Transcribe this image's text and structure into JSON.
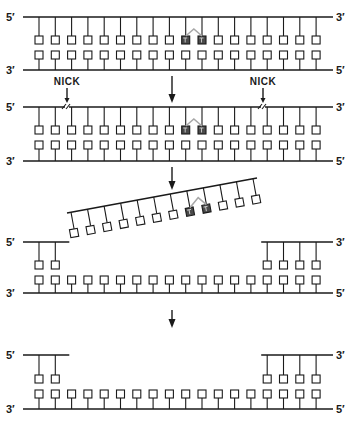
{
  "figure": {
    "width": 352,
    "height": 430,
    "colors": {
      "line": "#1a1a1a",
      "dimer": "#4a4a4a",
      "bridge": "#a8a8a8",
      "background": "#ffffff"
    }
  },
  "labels": {
    "five_prime": "5′",
    "three_prime": "3′",
    "nick": "NICK"
  },
  "layout": {
    "x_first": 39,
    "spacing": 16.3,
    "count": 18,
    "line_left": 23,
    "line_right": 333,
    "box": 8,
    "dimer_indices": [
      9,
      10
    ]
  },
  "panels": [
    {
      "id": "damaged-duplex",
      "top_y": 17,
      "top_box_y": 36,
      "bottom_box_y": 51,
      "bottom_y": 70,
      "top_segments": [
        [
          0,
          17
        ]
      ],
      "bottom_full": true,
      "dimer": true,
      "left_top_label": "5′",
      "right_top_label": "3′",
      "left_bottom_label": "3′",
      "right_bottom_label": "5′"
    },
    {
      "id": "nicked-duplex",
      "top_y": 107,
      "top_box_y": 126,
      "bottom_box_y": 141,
      "bottom_y": 161,
      "top_segments": [
        [
          0,
          17
        ]
      ],
      "bottom_full": true,
      "dimer": true,
      "nicks": [
        {
          "x": 67,
          "label": "NICK"
        },
        {
          "x": 263,
          "label": "NICK"
        }
      ],
      "left_top_label": "5′",
      "right_top_label": "3′",
      "left_bottom_label": "3′",
      "right_bottom_label": "5′"
    },
    {
      "id": "gapped-duplex",
      "top_y": 242,
      "top_box_y": 261,
      "bottom_box_y": 276,
      "bottom_y": 293,
      "top_segments": [
        [
          0,
          1
        ],
        [
          14,
          17
        ]
      ],
      "bottom_full": true,
      "dimer": false,
      "left_top_label": "5′",
      "right_top_label": "3′",
      "left_bottom_label": "3′",
      "right_bottom_label": "5′"
    },
    {
      "id": "repaired-gap-duplex",
      "top_y": 355,
      "top_box_y": 375,
      "bottom_box_y": 390,
      "bottom_y": 409,
      "top_segments": [
        [
          0,
          1
        ],
        [
          14,
          17
        ]
      ],
      "bottom_full": true,
      "dimer": false,
      "left_top_label": "5′",
      "right_top_label": "3′",
      "left_bottom_label": "3′",
      "right_bottom_label": "5′"
    }
  ],
  "excised_fragment": {
    "start": [
      67,
      213
    ],
    "end": [
      257,
      178
    ],
    "count": 12,
    "dimer_indices": [
      7,
      8
    ],
    "tick_length": 17
  },
  "arrows": [
    {
      "x": 172,
      "y1": 76,
      "y2": 103
    },
    {
      "x": 172,
      "y1": 167,
      "y2": 190
    },
    {
      "x": 172,
      "y1": 310,
      "y2": 328
    }
  ]
}
